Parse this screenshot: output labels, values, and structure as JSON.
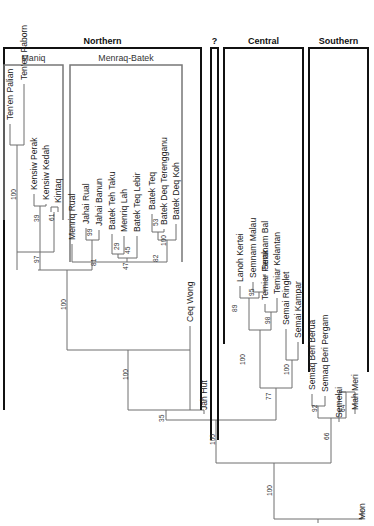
{
  "figure": {
    "type": "phylogenetic-tree",
    "orientation": "root-bottom, leaves-top, labels-rotated-90",
    "colors": {
      "branch": "#6e6e6e",
      "group_bracket": "#111111",
      "subgroup_bracket": "#777777",
      "text": "#222222"
    }
  },
  "groups": [
    {
      "id": "northern",
      "label": "Northern",
      "x1": 4,
      "x2": 201,
      "ytop": 48,
      "ybot": 410
    },
    {
      "id": "unknown",
      "label": "?",
      "x1": 211,
      "x2": 218,
      "ytop": 48,
      "ybot": 440
    },
    {
      "id": "central",
      "label": "Central",
      "x1": 224,
      "x2": 303,
      "ytop": 48,
      "ybot": 344
    },
    {
      "id": "southern",
      "label": "Southern",
      "x1": 309,
      "x2": 368,
      "ytop": 48,
      "ybot": 372
    }
  ],
  "subgroups": [
    {
      "id": "maniq",
      "label": "Maniq",
      "x1": 4,
      "x2": 63,
      "ytop": 65,
      "ybot": 220
    },
    {
      "id": "menraq-batek",
      "label": "Menraq-Batek",
      "x1": 70,
      "x2": 182,
      "ytop": 65,
      "ybot": 262
    }
  ],
  "leaves": [
    {
      "label": "Ten'en Palian",
      "x": 10,
      "y": 120
    },
    {
      "label": "Ten'en Paborn",
      "x": 24,
      "y": 80
    },
    {
      "label": "Kensiw Perak",
      "x": 34,
      "y": 190
    },
    {
      "label": "Kensiw Kedah",
      "x": 46,
      "y": 200
    },
    {
      "label": "Kintaq",
      "x": 58,
      "y": 203
    },
    {
      "label": "Menriq Rual",
      "x": 72,
      "y": 240
    },
    {
      "label": "Jahai Rual",
      "x": 86,
      "y": 224
    },
    {
      "label": "Jahai Banun",
      "x": 99,
      "y": 226
    },
    {
      "label": "Batek Teh Taku",
      "x": 112,
      "y": 230
    },
    {
      "label": "Menriq Lah",
      "x": 124,
      "y": 232
    },
    {
      "label": "Batek Teq Lebir",
      "x": 137,
      "y": 232
    },
    {
      "label": "Batek Teq",
      "x": 152,
      "y": 210
    },
    {
      "label": "Batek Deq Terengganu",
      "x": 164,
      "y": 225
    },
    {
      "label": "Batek Deq Koh",
      "x": 176,
      "y": 220
    },
    {
      "label": "Ceq Wong",
      "x": 190,
      "y": 322
    },
    {
      "label": "Jah Hut",
      "x": 204,
      "y": 410
    },
    {
      "label": "Lanoh Kertei",
      "x": 240,
      "y": 282
    },
    {
      "label": "Semnam Malau",
      "x": 253,
      "y": 278
    },
    {
      "label": "Semnam Bal",
      "x": 265,
      "y": 270
    },
    {
      "label": "Temiar Perak",
      "x": 265,
      "y": 300
    },
    {
      "label": "Temiar Kelantan",
      "x": 277,
      "y": 294
    },
    {
      "label": "Semai Ringlet",
      "x": 286,
      "y": 325
    },
    {
      "label": "Semai Kampar",
      "x": 298,
      "y": 338
    },
    {
      "label": "Semaq Beri Berua",
      "x": 312,
      "y": 390
    },
    {
      "label": "Semaq Beri Pergam",
      "x": 325,
      "y": 392
    },
    {
      "label": "Semelai",
      "x": 339,
      "y": 418
    },
    {
      "label": "Mah Meri",
      "x": 355,
      "y": 410
    },
    {
      "label": "Mon",
      "x": 362,
      "y": 520
    }
  ],
  "branches": [
    [
      10,
      124,
      10,
      145
    ],
    [
      24,
      84,
      24,
      145
    ],
    [
      10,
      145,
      24,
      145
    ],
    [
      17,
      145,
      17,
      252
    ],
    [
      34,
      194,
      34,
      206
    ],
    [
      46,
      204,
      46,
      206
    ],
    [
      34,
      206,
      46,
      206
    ],
    [
      40,
      206,
      40,
      252
    ],
    [
      51,
      207,
      58,
      207
    ],
    [
      51,
      207,
      51,
      212
    ],
    [
      58,
      207,
      58,
      212
    ],
    [
      54,
      212,
      54,
      252
    ],
    [
      17,
      252,
      54,
      252
    ],
    [
      40,
      252,
      40,
      270
    ],
    [
      17,
      252,
      17,
      270
    ],
    [
      72,
      244,
      72,
      262
    ],
    [
      86,
      228,
      86,
      240
    ],
    [
      99,
      230,
      99,
      240
    ],
    [
      86,
      240,
      99,
      240
    ],
    [
      92,
      240,
      92,
      262
    ],
    [
      112,
      234,
      112,
      254
    ],
    [
      124,
      236,
      124,
      254
    ],
    [
      112,
      254,
      124,
      254
    ],
    [
      118,
      254,
      118,
      258
    ],
    [
      137,
      236,
      137,
      258
    ],
    [
      118,
      258,
      137,
      258
    ],
    [
      127,
      258,
      127,
      262
    ],
    [
      152,
      214,
      152,
      232
    ],
    [
      164,
      229,
      164,
      232
    ],
    [
      152,
      232,
      164,
      232
    ],
    [
      158,
      232,
      158,
      240
    ],
    [
      176,
      224,
      176,
      240
    ],
    [
      158,
      240,
      176,
      240
    ],
    [
      167,
      240,
      167,
      262
    ],
    [
      72,
      262,
      167,
      262
    ],
    [
      92,
      262,
      92,
      270
    ],
    [
      38,
      270,
      92,
      270
    ],
    [
      67,
      270,
      67,
      350
    ],
    [
      190,
      326,
      190,
      410
    ],
    [
      67,
      350,
      190,
      350
    ],
    [
      128,
      350,
      128,
      410
    ],
    [
      128,
      410,
      204,
      410
    ],
    [
      204,
      414,
      204,
      410
    ],
    [
      166,
      410,
      166,
      420
    ],
    [
      240,
      286,
      240,
      298
    ],
    [
      253,
      282,
      253,
      292
    ],
    [
      265,
      274,
      265,
      292
    ],
    [
      253,
      292,
      265,
      292
    ],
    [
      259,
      292,
      259,
      298
    ],
    [
      240,
      298,
      259,
      298
    ],
    [
      249,
      298,
      249,
      330
    ],
    [
      265,
      304,
      265,
      312
    ],
    [
      277,
      298,
      277,
      312
    ],
    [
      265,
      312,
      277,
      312
    ],
    [
      271,
      312,
      271,
      330
    ],
    [
      249,
      330,
      271,
      330
    ],
    [
      260,
      330,
      260,
      388
    ],
    [
      286,
      329,
      286,
      360
    ],
    [
      298,
      342,
      298,
      360
    ],
    [
      286,
      360,
      298,
      360
    ],
    [
      292,
      360,
      292,
      388
    ],
    [
      260,
      388,
      292,
      388
    ],
    [
      276,
      388,
      276,
      420
    ],
    [
      166,
      420,
      276,
      420
    ],
    [
      216,
      420,
      216,
      463
    ],
    [
      312,
      394,
      312,
      406
    ],
    [
      325,
      396,
      325,
      406
    ],
    [
      312,
      406,
      325,
      406
    ],
    [
      318,
      406,
      318,
      418
    ],
    [
      339,
      422,
      339,
      392
    ],
    [
      339,
      392,
      339,
      392
    ],
    [
      339,
      392,
      346,
      392
    ],
    [
      355,
      414,
      355,
      392
    ],
    [
      339,
      392,
      355,
      392
    ],
    [
      346,
      392,
      346,
      404
    ],
    [
      346,
      404,
      346,
      418
    ],
    [
      318,
      418,
      346,
      418
    ],
    [
      331,
      418,
      331,
      463
    ],
    [
      216,
      463,
      331,
      463
    ],
    [
      274,
      463,
      274,
      519
    ],
    [
      274,
      519,
      362,
      519
    ],
    [
      362,
      519,
      362,
      510
    ],
    [
      318,
      519,
      318,
      523
    ]
  ],
  "bootstrap": [
    {
      "value": "100",
      "x": 14,
      "y": 200
    },
    {
      "value": "39",
      "x": 37,
      "y": 222
    },
    {
      "value": "97",
      "x": 37,
      "y": 263
    },
    {
      "value": "61",
      "x": 52,
      "y": 221
    },
    {
      "value": "100",
      "x": 64,
      "y": 310
    },
    {
      "value": "99",
      "x": 90,
      "y": 236
    },
    {
      "value": "81",
      "x": 94,
      "y": 266
    },
    {
      "value": "29",
      "x": 117,
      "y": 250
    },
    {
      "value": "45",
      "x": 128,
      "y": 254
    },
    {
      "value": "47",
      "x": 126,
      "y": 270
    },
    {
      "value": "53",
      "x": 156,
      "y": 226
    },
    {
      "value": "100",
      "x": 164,
      "y": 246
    },
    {
      "value": "82",
      "x": 156,
      "y": 262
    },
    {
      "value": "100",
      "x": 126,
      "y": 380
    },
    {
      "value": "35",
      "x": 162,
      "y": 422
    },
    {
      "value": "89",
      "x": 235,
      "y": 312
    },
    {
      "value": "95",
      "x": 252,
      "y": 296
    },
    {
      "value": "98",
      "x": 268,
      "y": 324
    },
    {
      "value": "100",
      "x": 243,
      "y": 365
    },
    {
      "value": "100",
      "x": 287,
      "y": 375
    },
    {
      "value": "77",
      "x": 269,
      "y": 400
    },
    {
      "value": "100",
      "x": 213,
      "y": 445
    },
    {
      "value": "92",
      "x": 315,
      "y": 412
    },
    {
      "value": "64",
      "x": 343,
      "y": 412
    },
    {
      "value": "66",
      "x": 327,
      "y": 440
    },
    {
      "value": "100",
      "x": 270,
      "y": 496
    }
  ]
}
